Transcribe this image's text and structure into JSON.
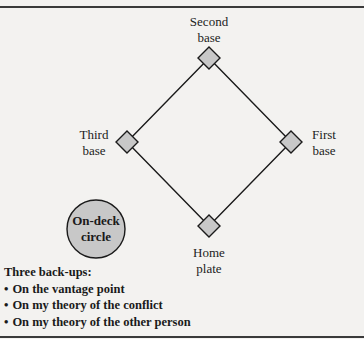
{
  "diagram": {
    "type": "baseball-diamond",
    "bases": {
      "second": {
        "line1": "Second",
        "line2": "base"
      },
      "third": {
        "line1": "Third",
        "line2": "base"
      },
      "first": {
        "line1": "First",
        "line2": "base"
      },
      "home": {
        "line1": "Home",
        "line2": "plate"
      }
    },
    "on_deck": {
      "line1": "On-deck",
      "line2": "circle"
    },
    "colors": {
      "fill": "#c8c8c8",
      "stroke": "#1a1a1a",
      "background": "#f3f2f0"
    }
  },
  "backups": {
    "heading": "Three back-ups:",
    "items": [
      "On the vantage point",
      "On my theory of the conflict",
      "On my theory of the other person"
    ]
  }
}
